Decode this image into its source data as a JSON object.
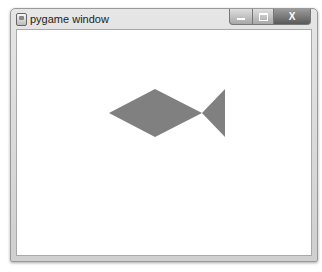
{
  "window": {
    "title": "pygame window",
    "controls": {
      "minimize": "minimize",
      "maximize": "maximize",
      "close": "X"
    }
  },
  "canvas": {
    "background": "#ffffff",
    "fish": {
      "color": "#808080",
      "body_points": "92,83 138,59 185,83 138,107",
      "tail_points": "185,83 208,59 208,107"
    }
  }
}
